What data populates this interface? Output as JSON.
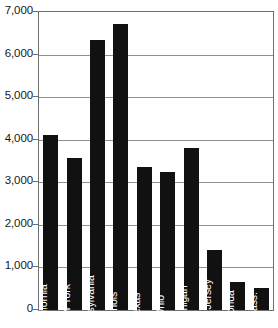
{
  "chart_data": {
    "type": "bar",
    "title": "",
    "subtitle": "",
    "xlabel": "",
    "ylabel": "",
    "categories": [
      "California",
      "New York",
      "Pennsylvania",
      "Illinois",
      "Texas",
      "Ohio",
      "Michigan",
      "New Jersey",
      "Florida",
      "Mass."
    ],
    "values": [
      4120,
      3580,
      6350,
      6720,
      3350,
      3250,
      3800,
      1400,
      650,
      520
    ],
    "ylim": [
      0,
      7000
    ],
    "ytick_labels": [
      "7,000",
      "6,000",
      "5,000",
      "4,000",
      "3,000",
      "2,000",
      "1,000",
      "0"
    ],
    "ytick_values": [
      7000,
      6000,
      5000,
      4000,
      3000,
      2000,
      1000,
      0
    ],
    "grid": true,
    "grid_axis": "y",
    "legend": false,
    "legend_position": "none",
    "bar_color": "#111112",
    "grid_color": "#8e8f91",
    "frame_color": "#6d6e70",
    "label_color": "#ffffff",
    "tick_label_color": "#18181a",
    "background_color": "#ffffff",
    "label_orientation": "vertical",
    "label_placement": "inside-bar-bottom"
  }
}
